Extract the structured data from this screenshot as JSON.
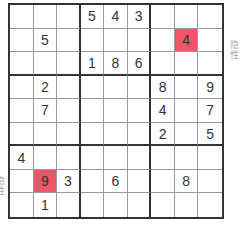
{
  "puzzle": {
    "rows": [
      [
        "",
        "",
        "",
        "5",
        "4",
        "3",
        "",
        "",
        ""
      ],
      [
        "",
        "5",
        "",
        "",
        "",
        "",
        "",
        "4",
        ""
      ],
      [
        "",
        "",
        "",
        "1",
        "8",
        "6",
        "",
        "",
        ""
      ],
      [
        "",
        "2",
        "",
        "",
        "",
        "",
        "8",
        "",
        "9"
      ],
      [
        "",
        "7",
        "",
        "",
        "",
        "",
        "4",
        "",
        "7"
      ],
      [
        "",
        "",
        "",
        "",
        "",
        "",
        "2",
        "",
        "5"
      ],
      [
        "4",
        "",
        "",
        "",
        "",
        "",
        "",
        "",
        ""
      ],
      [
        "",
        "9",
        "3",
        "",
        "6",
        "",
        "",
        "8",
        ""
      ],
      [
        "",
        "1",
        "",
        "",
        "",
        "",
        "",
        "",
        ""
      ]
    ],
    "highlighted": [
      [
        1,
        7
      ],
      [
        7,
        1
      ]
    ],
    "highlight_color": "#ee5566"
  },
  "labels": {
    "right": "隐性",
    "left": "隐性"
  }
}
